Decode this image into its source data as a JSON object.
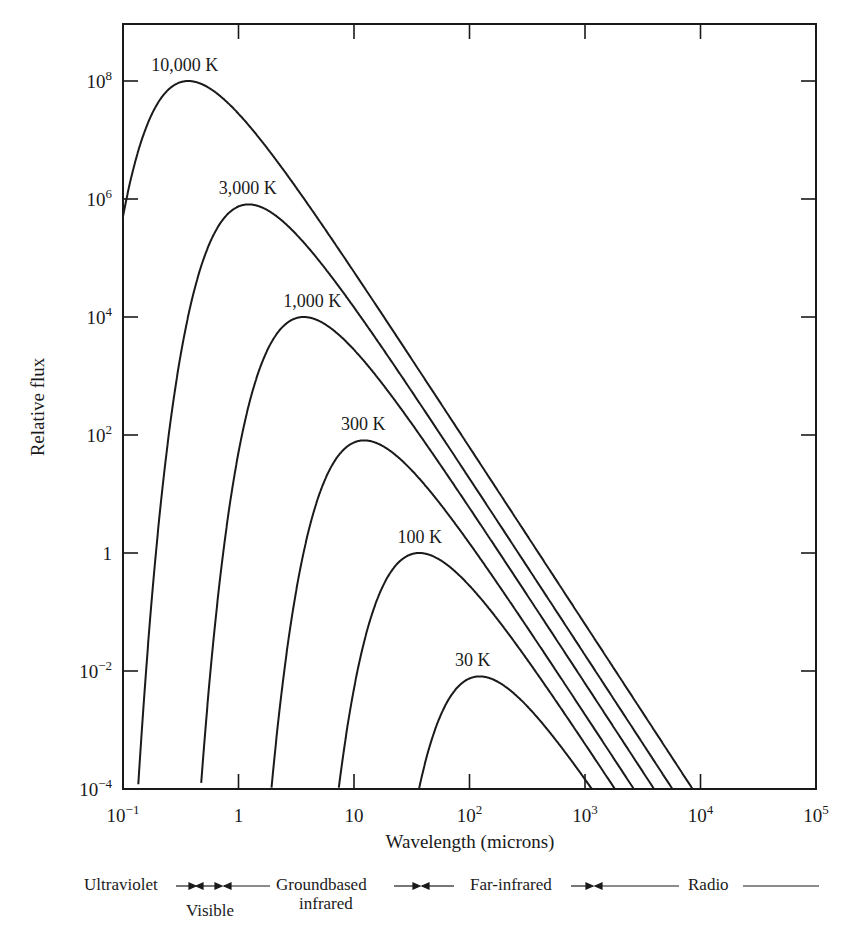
{
  "chart_data": {
    "type": "line",
    "title": "",
    "xlabel": "Wavelength (microns)",
    "ylabel": "Relative flux",
    "xscale": "log",
    "yscale": "log",
    "xlim": [
      0.1,
      100000
    ],
    "ylim": [
      0.0001,
      1000000000
    ],
    "grid": false,
    "legend": "inline labels at curve peaks",
    "x_ticks": [
      {
        "value": 0.1,
        "label_base": "10",
        "label_exp": "−1"
      },
      {
        "value": 1,
        "label_base": "1",
        "label_exp": ""
      },
      {
        "value": 10,
        "label_base": "10",
        "label_exp": ""
      },
      {
        "value": 100,
        "label_base": "10",
        "label_exp": "2"
      },
      {
        "value": 1000,
        "label_base": "10",
        "label_exp": "3"
      },
      {
        "value": 10000,
        "label_base": "10",
        "label_exp": "4"
      },
      {
        "value": 100000,
        "label_base": "10",
        "label_exp": "5"
      }
    ],
    "y_ticks": [
      {
        "value": 0.0001,
        "label_base": "10",
        "label_exp": "−4"
      },
      {
        "value": 0.01,
        "label_base": "10",
        "label_exp": "−2"
      },
      {
        "value": 1,
        "label_base": "1",
        "label_exp": ""
      },
      {
        "value": 100,
        "label_base": "10",
        "label_exp": "2"
      },
      {
        "value": 10000,
        "label_base": "10",
        "label_exp": "4"
      },
      {
        "value": 1000000,
        "label_base": "10",
        "label_exp": "6"
      },
      {
        "value": 100000000,
        "label_base": "10",
        "label_exp": "8"
      }
    ],
    "series": [
      {
        "name": "10,000 K",
        "temperature_K": 10000,
        "peak_wavelength_um": 0.37,
        "peak_flux": 100000000,
        "points": [
          [
            0.1,
            1200000
          ],
          [
            0.2,
            55000000
          ],
          [
            0.37,
            100000000
          ],
          [
            1,
            22000000
          ],
          [
            10,
            3400
          ],
          [
            100,
            0.34
          ],
          [
            1000,
            3.4e-05
          ],
          [
            8000,
            0.0001
          ]
        ]
      },
      {
        "name": "3,000 K",
        "temperature_K": 3000,
        "peak_wavelength_um": 1.2,
        "peak_flux": 810000,
        "points": [
          [
            0.1,
            0.0001
          ],
          [
            0.3,
            26000
          ],
          [
            1.2,
            810000
          ],
          [
            10,
            1000
          ],
          [
            100,
            0.1
          ],
          [
            1000,
            1e-05
          ],
          [
            5200,
            0.0001
          ]
        ]
      },
      {
        "name": "1,000 K",
        "temperature_K": 1000,
        "peak_wavelength_um": 3.7,
        "peak_flux": 10000,
        "points": [
          [
            0.4,
            0.0001
          ],
          [
            1,
            160
          ],
          [
            3.7,
            10000
          ],
          [
            10,
            3100
          ],
          [
            100,
            0.34
          ],
          [
            1000,
            3.4e-05
          ],
          [
            3500,
            0.0001
          ]
        ]
      },
      {
        "name": "300 K",
        "temperature_K": 300,
        "peak_wavelength_um": 12,
        "peak_flux": 81,
        "points": [
          [
            1.7,
            0.0001
          ],
          [
            5,
            12
          ],
          [
            12,
            81
          ],
          [
            100,
            0.1
          ],
          [
            1000,
            1e-05
          ],
          [
            2300,
            0.0001
          ]
        ]
      },
      {
        "name": "100 K",
        "temperature_K": 100,
        "peak_wavelength_um": 37,
        "peak_flux": 1,
        "points": [
          [
            6,
            0.0001
          ],
          [
            15,
            0.16
          ],
          [
            37,
            1
          ],
          [
            100,
            0.31
          ],
          [
            1000,
            3.3e-05
          ],
          [
            1500,
            0.0001
          ]
        ]
      },
      {
        "name": "30 K",
        "temperature_K": 30,
        "peak_wavelength_um": 120,
        "peak_flux": 0.0081,
        "points": [
          [
            30,
            0.0001
          ],
          [
            60,
            0.0035
          ],
          [
            120,
            0.0081
          ],
          [
            300,
            0.0035
          ],
          [
            1000,
            0.0001
          ]
        ]
      }
    ],
    "annotations": {
      "bands": [
        {
          "label": "Ultraviolet"
        },
        {
          "label": "Visible"
        },
        {
          "label": "Groundbased infrared"
        },
        {
          "label": "Far-infrared"
        },
        {
          "label": "Radio"
        }
      ]
    }
  },
  "bands": {
    "ultraviolet": "Ultraviolet",
    "visible": "Visible",
    "groundbased_line1": "Groundbased",
    "groundbased_line2": "infrared",
    "far_infrared": "Far-infrared",
    "radio": "Radio"
  },
  "colors": {
    "ink": "#1a1a1a",
    "background": "#ffffff"
  }
}
